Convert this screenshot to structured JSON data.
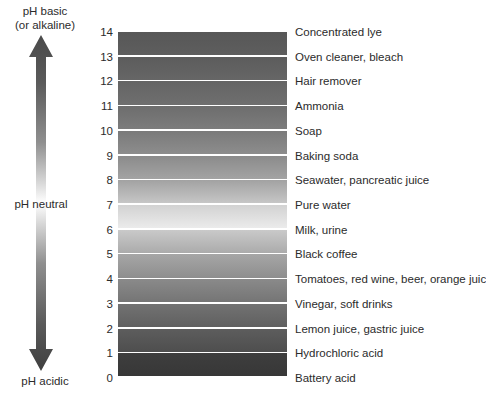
{
  "chart_data": {
    "type": "bar",
    "xlabel": "",
    "ylabel": "pH",
    "orientation": "vertical",
    "ylim": [
      0,
      14
    ],
    "grid": false,
    "legend": null,
    "categories": [
      14,
      13,
      12,
      11,
      10,
      9,
      8,
      7,
      6,
      5,
      4,
      3,
      2,
      1,
      0
    ],
    "values": [
      14,
      13,
      12,
      11,
      10,
      9,
      8,
      7,
      6,
      5,
      4,
      3,
      2,
      1,
      0
    ],
    "annotations": {
      "top_axis_label": "pH basic\n(or alkaline)",
      "middle_axis_label": "pH neutral",
      "bottom_axis_label": "pH acidic"
    },
    "bands": [
      {
        "ph": "14",
        "label": "Concentrated lye",
        "shade_top": "#575757",
        "shade_bottom": "#5e5e5e"
      },
      {
        "ph": "13",
        "label": "Oven cleaner, bleach",
        "shade_top": "#5c5c5c",
        "shade_bottom": "#666666"
      },
      {
        "ph": "12",
        "label": "Hair remover",
        "shade_top": "#646464",
        "shade_bottom": "#6f6f6f"
      },
      {
        "ph": "11",
        "label": "Ammonia",
        "shade_top": "#6d6d6d",
        "shade_bottom": "#7c7c7c"
      },
      {
        "ph": "10",
        "label": "Soap",
        "shade_top": "#7a7a7a",
        "shade_bottom": "#8d8d8d"
      },
      {
        "ph": "9",
        "label": "Baking soda",
        "shade_top": "#8b8b8b",
        "shade_bottom": "#a3a3a3"
      },
      {
        "ph": "8",
        "label": "Seawater, pancreatic juice",
        "shade_top": "#a2a2a2",
        "shade_bottom": "#c6c6c6"
      },
      {
        "ph": "7",
        "label": "Pure water",
        "shade_top": "#d2d2d2",
        "shade_bottom": "#ebebeb"
      },
      {
        "ph": "6",
        "label": "Milk, urine",
        "shade_top": "#c9c9c9",
        "shade_bottom": "#ababab"
      },
      {
        "ph": "5",
        "label": "Black coffee",
        "shade_top": "#a6a6a6",
        "shade_bottom": "#8e8e8e"
      },
      {
        "ph": "4",
        "label": "Tomatoes, red wine, beer, orange juice",
        "shade_top": "#8a8a8a",
        "shade_bottom": "#757575"
      },
      {
        "ph": "3",
        "label": "Vinegar, soft drinks",
        "shade_top": "#727272",
        "shade_bottom": "#606060"
      },
      {
        "ph": "2",
        "label": "Lemon juice, gastric juice",
        "shade_top": "#5d5d5d",
        "shade_bottom": "#4e4e4e"
      },
      {
        "ph": "1",
        "label": "Hydrochloric acid",
        "shade_top": "#4c4c4c",
        "shade_bottom": "#404040"
      },
      {
        "ph": "0",
        "label": "Battery acid",
        "shade_top": "#3e3e3e",
        "shade_bottom": "#373737"
      }
    ]
  },
  "arrow": {
    "top_label": "pH basic\n(or alkaline)",
    "neutral_label": "pH neutral",
    "bottom_label": "pH acidic",
    "color_dark": "#4a4a4a",
    "color_light": "#ffffff"
  },
  "colors": {
    "background": "#ffffff",
    "text": "#2b2b2b",
    "separator": "#ffffff"
  }
}
